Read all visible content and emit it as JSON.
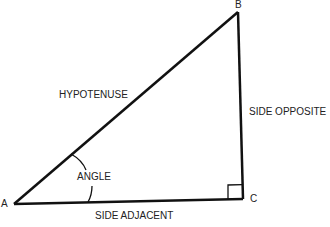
{
  "diagram": {
    "type": "right-triangle",
    "vertices": {
      "A": {
        "label": "A",
        "x": 14,
        "y": 204
      },
      "B": {
        "label": "B",
        "x": 238,
        "y": 12
      },
      "C": {
        "label": "C",
        "x": 243,
        "y": 199
      }
    },
    "labels": {
      "hypotenuse": "HYPOTENUSE",
      "side_opposite": "SIDE OPPOSITE",
      "side_adjacent": "SIDE ADJACENT",
      "angle": "ANGLE"
    },
    "line_color": "#111111"
  }
}
